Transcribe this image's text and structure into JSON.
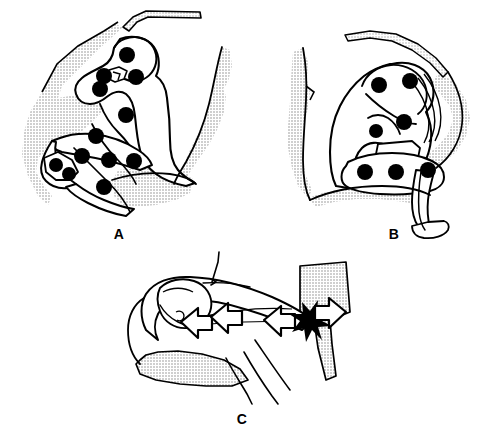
{
  "figure": {
    "background_color": "#ffffff",
    "line_color": "#000000",
    "shade_color": "#d9d9d9",
    "dot_color": "#000000",
    "width": 491,
    "height": 439
  },
  "panels": [
    {
      "id": "a",
      "label": "A",
      "caption": "Fetus in utero, left lateral view with maternal pelvis shaded; black dots mark fetal landmark points",
      "dot_count": 12,
      "dots": [
        {
          "cx": 127,
          "cy": 55,
          "r": 8
        },
        {
          "cx": 104,
          "cy": 76,
          "r": 8
        },
        {
          "cx": 136,
          "cy": 77,
          "r": 8
        },
        {
          "cx": 100,
          "cy": 89,
          "r": 8
        },
        {
          "cx": 126,
          "cy": 115,
          "r": 8
        },
        {
          "cx": 96,
          "cy": 136,
          "r": 8
        },
        {
          "cx": 82,
          "cy": 156,
          "r": 8
        },
        {
          "cx": 109,
          "cy": 160,
          "r": 8
        },
        {
          "cx": 134,
          "cy": 161,
          "r": 8
        },
        {
          "cx": 56,
          "cy": 165,
          "r": 7
        },
        {
          "cx": 69,
          "cy": 174,
          "r": 7
        },
        {
          "cx": 104,
          "cy": 187,
          "r": 8
        }
      ]
    },
    {
      "id": "b",
      "label": "B",
      "caption": "Fetus in utero after descent, black dots mark the same landmark points in new positions",
      "dot_count": 6,
      "dots": [
        {
          "cx": 379,
          "cy": 85,
          "r": 8
        },
        {
          "cx": 410,
          "cy": 81,
          "r": 8
        },
        {
          "cx": 404,
          "cy": 122,
          "r": 8
        },
        {
          "cx": 376,
          "cy": 131,
          "r": 7
        },
        {
          "cx": 365,
          "cy": 172,
          "r": 8
        },
        {
          "cx": 396,
          "cy": 172,
          "r": 8
        },
        {
          "cx": 428,
          "cy": 170,
          "r": 8
        }
      ]
    },
    {
      "id": "c",
      "label": "C",
      "caption": "Close-up of fetal head against maternal sacrum with opposing force arrows and impact burst",
      "arrows": [
        {
          "name": "force-arrow-left-outer",
          "direction": "left"
        },
        {
          "name": "force-arrow-left-inner",
          "direction": "left"
        },
        {
          "name": "force-arrow-right-inner",
          "direction": "left"
        },
        {
          "name": "force-arrow-right-outer",
          "direction": "right"
        }
      ],
      "burst": {
        "name": "impact-burst",
        "points": 8
      }
    }
  ]
}
